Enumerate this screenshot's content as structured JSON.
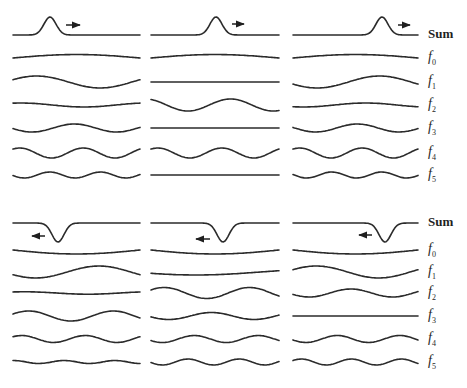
{
  "figure": {
    "columns_x": [
      [
        13,
        140
      ],
      [
        151,
        279
      ],
      [
        293,
        418
      ]
    ],
    "groups": [
      {
        "name": "top-group-right-moving-pulse",
        "pulse": {
          "sign": 1,
          "direction": "right",
          "amplitude": 18,
          "width": 8.5,
          "centers": [
            50,
            216,
            382
          ],
          "arrows": [
            {
              "x1": 66,
              "x2": 80,
              "y": 25
            },
            {
              "x1": 232,
              "x2": 244,
              "y": 24
            },
            {
              "x1": 398,
              "x2": 410,
              "y": 25
            }
          ]
        },
        "rows": [
          {
            "key": "sum",
            "label": "Sum",
            "sub": "",
            "y": 35
          },
          {
            "key": "f0",
            "label": "f",
            "sub": "0",
            "y": 58,
            "waves": [
              {
                "amp": 3.5,
                "cycles": 0.5,
                "phase": 0,
                "mode": "arch"
              },
              {
                "amp": 3.5,
                "cycles": 0.5,
                "phase": 0,
                "mode": "arch"
              },
              {
                "amp": 3.5,
                "cycles": 0.5,
                "phase": 0,
                "mode": "arch"
              }
            ]
          },
          {
            "key": "f1",
            "label": "f",
            "sub": "1",
            "y": 82,
            "waves": [
              {
                "amp": 6,
                "cycles": 1,
                "phase": 0.4
              },
              {
                "amp": 0,
                "cycles": 1,
                "phase": 0
              },
              {
                "amp": 6,
                "cycles": 1,
                "phase": 3.5
              }
            ]
          },
          {
            "key": "f2",
            "label": "f",
            "sub": "2",
            "y": 105,
            "waves": [
              {
                "amp": 2,
                "cycles": 1,
                "phase": 1.2
              },
              {
                "amp": 6,
                "cycles": 1.5,
                "phase": 2.0
              },
              {
                "amp": 2,
                "cycles": 1,
                "phase": 4.2
              }
            ]
          },
          {
            "key": "f3",
            "label": "f",
            "sub": "3",
            "y": 128,
            "waves": [
              {
                "amp": 4,
                "cycles": 1.5,
                "phase": 3.3
              },
              {
                "amp": 0,
                "cycles": 1.5,
                "phase": 0
              },
              {
                "amp": 4,
                "cycles": 1.5,
                "phase": 3.0
              }
            ]
          },
          {
            "key": "f4",
            "label": "f",
            "sub": "4",
            "y": 153,
            "waves": [
              {
                "amp": 5,
                "cycles": 2,
                "phase": 0.9
              },
              {
                "amp": 5,
                "cycles": 2,
                "phase": 0.9
              },
              {
                "amp": 5,
                "cycles": 2,
                "phase": 0.9
              }
            ]
          },
          {
            "key": "f5",
            "label": "f",
            "sub": "5",
            "y": 175,
            "waves": [
              {
                "amp": 3,
                "cycles": 2.5,
                "phase": 3.3
              },
              {
                "amp": 0,
                "cycles": 2.5,
                "phase": 0
              },
              {
                "amp": 3,
                "cycles": 2.5,
                "phase": 3.0
              }
            ]
          }
        ]
      },
      {
        "name": "bottom-group-left-moving-trough",
        "pulse": {
          "sign": -1,
          "direction": "left",
          "amplitude": 19,
          "width": 8.5,
          "centers": [
            58,
            223,
            385
          ],
          "arrows": [
            {
              "x1": 45,
              "x2": 32,
              "y": 236
            },
            {
              "x1": 210,
              "x2": 196,
              "y": 239
            },
            {
              "x1": 372,
              "x2": 359,
              "y": 235
            }
          ]
        },
        "rows": [
          {
            "key": "sum",
            "label": "Sum",
            "sub": "",
            "y": 223
          },
          {
            "key": "f0",
            "label": "f",
            "sub": "0",
            "y": 250,
            "waves": [
              {
                "amp": -4,
                "cycles": 0.5,
                "phase": 0,
                "mode": "arch"
              },
              {
                "amp": -4,
                "cycles": 0.5,
                "phase": 0,
                "mode": "arch"
              },
              {
                "amp": -4,
                "cycles": 0.5,
                "phase": 0,
                "mode": "arch"
              }
            ]
          },
          {
            "key": "f1",
            "label": "f",
            "sub": "1",
            "y": 272,
            "waves": [
              {
                "amp": 6,
                "cycles": 1,
                "phase": 3.6
              },
              {
                "amp": 3,
                "cycles": 0.5,
                "phase": 3.6
              },
              {
                "amp": 6,
                "cycles": 1,
                "phase": 0.4
              }
            ]
          },
          {
            "key": "f2",
            "label": "f",
            "sub": "2",
            "y": 293,
            "waves": [
              {
                "amp": 1.2,
                "cycles": 1,
                "phase": 1.0
              },
              {
                "amp": 5.5,
                "cycles": 1.5,
                "phase": 0.6
              },
              {
                "amp": 4,
                "cycles": 1.5,
                "phase": 3.5
              }
            ]
          },
          {
            "key": "f3",
            "label": "f",
            "sub": "3",
            "y": 316,
            "waves": [
              {
                "amp": 5,
                "cycles": 1.5,
                "phase": 0.4
              },
              {
                "amp": 3.5,
                "cycles": 1.5,
                "phase": 3.4
              },
              {
                "amp": 0,
                "cycles": 1.5,
                "phase": 0
              }
            ]
          },
          {
            "key": "f4",
            "label": "f",
            "sub": "4",
            "y": 339,
            "waves": [
              {
                "amp": 3.5,
                "cycles": 2,
                "phase": 0.7
              },
              {
                "amp": 3.5,
                "cycles": 2,
                "phase": 3.6
              },
              {
                "amp": 3.5,
                "cycles": 2,
                "phase": 3.4
              }
            ]
          },
          {
            "key": "f5",
            "label": "f",
            "sub": "5",
            "y": 362,
            "waves": [
              {
                "amp": 1.5,
                "cycles": 2.5,
                "phase": 1.5
              },
              {
                "amp": 3,
                "cycles": 2.5,
                "phase": 3.3
              },
              {
                "amp": 3,
                "cycles": 2.5,
                "phase": 0.5
              }
            ]
          }
        ]
      }
    ],
    "labels_x": 428
  }
}
